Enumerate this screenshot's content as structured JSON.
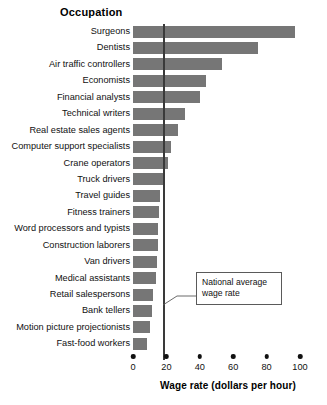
{
  "chart_data": {
    "type": "bar",
    "orientation": "horizontal",
    "title": "Occupation",
    "xlabel": "Wage rate (dollars per hour)",
    "ylabel": "Occupation",
    "xlim": [
      0,
      100
    ],
    "grid": false,
    "legend": null,
    "tick_labels": [
      "0",
      "20",
      "40",
      "60",
      "80",
      "100"
    ],
    "ticks": [
      0,
      20,
      40,
      60,
      80,
      100
    ],
    "categories": [
      "Surgeons",
      "Dentists",
      "Air traffic controllers",
      "Economists",
      "Financial analysts",
      "Technical writers",
      "Real estate sales agents",
      "Computer support specialists",
      "Crane operators",
      "Truck drivers",
      "Travel guides",
      "Fitness trainers",
      "Word processors and typists",
      "Construction laborers",
      "Van drivers",
      "Medical assistants",
      "Retail salespersons",
      "Bank tellers",
      "Motion picture projectionists",
      "Fast-food workers"
    ],
    "values": [
      97,
      75,
      53,
      44,
      40,
      31,
      27,
      23,
      21,
      18.5,
      16,
      15.5,
      15,
      15,
      14.5,
      14,
      12,
      11.5,
      10,
      8.5
    ],
    "annotations": [
      {
        "name": "national-average-wage-rate",
        "text": "National average wage rate",
        "text_line1": "National average",
        "text_line2": "wage rate",
        "value": 18
      }
    ],
    "colors": {
      "bar": "#767676",
      "reference_line": "#3a3a3a",
      "text": "#111111",
      "background": "#ffffff"
    }
  }
}
